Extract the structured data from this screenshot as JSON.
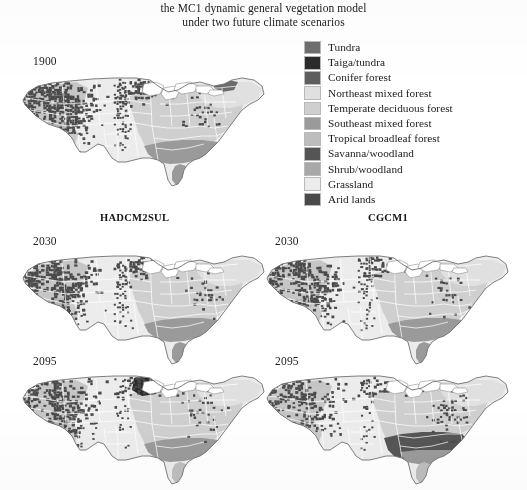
{
  "figure": {
    "title_line1": "the MC1 dynamic general vegetation model",
    "title_line2": "under two future climate scenarios"
  },
  "legend": {
    "items": [
      {
        "label": "Tundra",
        "color": "#6e6e6e"
      },
      {
        "label": "Taiga/tundra",
        "color": "#2b2b2b"
      },
      {
        "label": "Conifer forest",
        "color": "#5e5e5e"
      },
      {
        "label": "Northeast mixed forest",
        "color": "#e0e0e0"
      },
      {
        "label": "Temperate deciduous forest",
        "color": "#cfcfcf"
      },
      {
        "label": "Southeast mixed forest",
        "color": "#9a9a9a"
      },
      {
        "label": "Tropical broadleaf forest",
        "color": "#bdbdbd"
      },
      {
        "label": "Savanna/woodland",
        "color": "#555555"
      },
      {
        "label": "Shrub/woodland",
        "color": "#a8a8a8"
      },
      {
        "label": "Grassland",
        "color": "#ececec"
      },
      {
        "label": "Arid lands",
        "color": "#4a4a4a"
      }
    ]
  },
  "scenarios": {
    "left_label": "HADCM2SUL",
    "right_label": "CGCM1"
  },
  "panels": [
    {
      "id": "baseline-1900",
      "year": "1900",
      "scenario": "",
      "position": "top-left"
    },
    {
      "id": "hadcm2sul-2030",
      "year": "2030",
      "scenario": "HADCM2SUL",
      "position": "middle-left"
    },
    {
      "id": "cgcm1-2030",
      "year": "2030",
      "scenario": "CGCM1",
      "position": "middle-right"
    },
    {
      "id": "hadcm2sul-2095",
      "year": "2095",
      "scenario": "HADCM2SUL",
      "position": "bottom-left"
    },
    {
      "id": "cgcm1-2095",
      "year": "2095",
      "scenario": "CGCM1",
      "position": "bottom-right"
    }
  ],
  "chart_data": {
    "type": "map",
    "title": "the MC1 dynamic general vegetation model under two future climate scenarios",
    "region": "Conterminous United States",
    "categories": [
      "Tundra",
      "Taiga/tundra",
      "Conifer forest",
      "Northeast mixed forest",
      "Temperate deciduous forest",
      "Southeast mixed forest",
      "Tropical broadleaf forest",
      "Savanna/woodland",
      "Shrub/woodland",
      "Grassland",
      "Arid lands"
    ],
    "category_colors": [
      "#6e6e6e",
      "#2b2b2b",
      "#5e5e5e",
      "#e0e0e0",
      "#cfcfcf",
      "#9a9a9a",
      "#bdbdbd",
      "#555555",
      "#a8a8a8",
      "#ececec",
      "#4a4a4a"
    ],
    "panels": [
      {
        "name": "1900",
        "scenario": "baseline",
        "year": 1900,
        "dominant_classes": [
          "Conifer forest",
          "Grassland",
          "Temperate deciduous forest",
          "Southeast mixed forest",
          "Shrub/woodland"
        ]
      },
      {
        "name": "2030 HADCM2SUL",
        "scenario": "HADCM2SUL",
        "year": 2030,
        "dominant_classes": [
          "Conifer forest",
          "Grassland",
          "Temperate deciduous forest",
          "Southeast mixed forest"
        ]
      },
      {
        "name": "2030 CGCM1",
        "scenario": "CGCM1",
        "year": 2030,
        "dominant_classes": [
          "Conifer forest",
          "Grassland",
          "Temperate deciduous forest",
          "Southeast mixed forest"
        ]
      },
      {
        "name": "2095 HADCM2SUL",
        "scenario": "HADCM2SUL",
        "year": 2095,
        "dominant_classes": [
          "Conifer forest",
          "Grassland",
          "Temperate deciduous forest",
          "Southeast mixed forest",
          "Savanna/woodland"
        ]
      },
      {
        "name": "2095 CGCM1",
        "scenario": "CGCM1",
        "year": 2095,
        "dominant_classes": [
          "Conifer forest",
          "Savanna/woodland",
          "Grassland",
          "Temperate deciduous forest"
        ]
      }
    ],
    "legend_position": "top-right",
    "grid": false
  }
}
